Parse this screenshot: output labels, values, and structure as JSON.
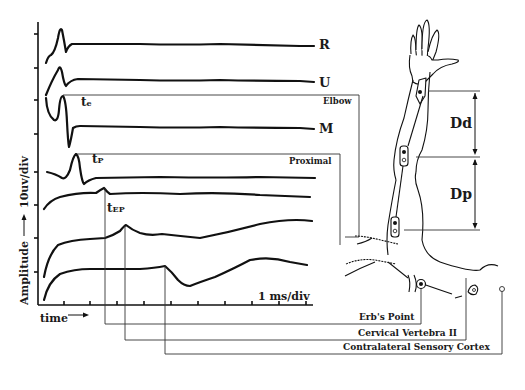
{
  "figure": {
    "trace_labels": {
      "R": "R",
      "U": "U",
      "M": "M"
    },
    "latency_labels": {
      "te": "t",
      "te_sub": "e",
      "tp": "t",
      "tp_sub": "P",
      "tep": "t",
      "tep_sub": "EP"
    },
    "site_labels": {
      "elbow": "Elbow",
      "proximal": "Proximal",
      "erbs_point": "Erb's Point",
      "cervical": "Cervical Vertebra II",
      "cortex": "Contralateral Sensory Cortex"
    },
    "distance_labels": {
      "distal": "Dd",
      "proximal": "Dp"
    },
    "axes": {
      "y_scale": "10uv/div",
      "y_label": "Amplitude",
      "x_scale": "1 ms/div",
      "x_label": "time"
    }
  }
}
